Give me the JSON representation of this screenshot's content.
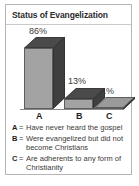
{
  "panel": {
    "title": "Status of Evangelization",
    "border_color": "#b5b5b5",
    "background": "#ffffff"
  },
  "chart_data": {
    "type": "bar",
    "title": "Status of Evangelization",
    "xlabel": "",
    "ylabel": "",
    "categories": [
      "A",
      "B",
      "C"
    ],
    "values": [
      86,
      13,
      1
    ],
    "value_labels": [
      "86%",
      "13%",
      "1%"
    ],
    "ylim": [
      0,
      100
    ],
    "grid": false,
    "legend_position": "below",
    "style": "3d-bar",
    "colors": {
      "bar_front": "#a3a3a3",
      "bar_top": "#4a4a4a",
      "bar_side": "#3f3f3f",
      "outline": "#5d5d5d",
      "text": "#3a3a3a"
    }
  },
  "axis": {
    "labels": [
      "A",
      "B",
      "C"
    ]
  },
  "legend": {
    "entries": [
      {
        "key": "A",
        "eq": "=",
        "text": "Have never heard the gospel"
      },
      {
        "key": "B",
        "eq": "=",
        "text": "Were evangelized but did not become Christians"
      },
      {
        "key": "C",
        "eq": "=",
        "text": "Are adherents to any form of Christianity"
      }
    ]
  }
}
